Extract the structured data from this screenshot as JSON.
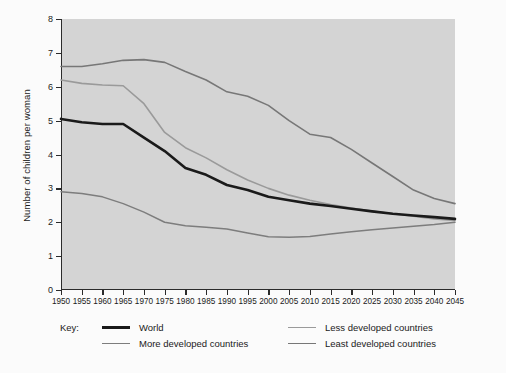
{
  "chart_data": {
    "type": "line",
    "title": "",
    "xlabel": "",
    "ylabel": "Number of children per woman",
    "xlim": [
      1950,
      2045
    ],
    "ylim": [
      0,
      8
    ],
    "yticks": [
      0,
      1,
      2,
      3,
      4,
      5,
      6,
      7,
      8
    ],
    "grid": false,
    "legend_position": "bottom",
    "legend_title": "Key:",
    "x": [
      1950,
      1955,
      1960,
      1965,
      1970,
      1975,
      1980,
      1985,
      1990,
      1995,
      2000,
      2005,
      2010,
      2015,
      2020,
      2025,
      2030,
      2035,
      2040,
      2045
    ],
    "series": [
      {
        "name": "World",
        "color": "#1a1a1a",
        "width": 2.6,
        "values": [
          5.05,
          4.95,
          4.9,
          4.9,
          4.5,
          4.1,
          3.6,
          3.4,
          3.1,
          2.95,
          2.75,
          2.65,
          2.55,
          2.48,
          2.4,
          2.32,
          2.25,
          2.2,
          2.15,
          2.1
        ]
      },
      {
        "name": "More developed countries",
        "color": "#7d7d7d",
        "width": 1.5,
        "values": [
          2.9,
          2.85,
          2.75,
          2.55,
          2.3,
          2.0,
          1.9,
          1.85,
          1.8,
          1.68,
          1.57,
          1.56,
          1.58,
          1.65,
          1.72,
          1.78,
          1.83,
          1.88,
          1.93,
          2.0
        ]
      },
      {
        "name": "Less developed countries",
        "color": "#9a9a9a",
        "width": 1.6,
        "values": [
          6.2,
          6.1,
          6.05,
          6.03,
          5.5,
          4.65,
          4.2,
          3.9,
          3.55,
          3.25,
          3.0,
          2.8,
          2.65,
          2.52,
          2.42,
          2.33,
          2.25,
          2.18,
          2.1,
          2.05
        ]
      },
      {
        "name": "Least developed countries",
        "color": "#777777",
        "width": 1.6,
        "values": [
          6.6,
          6.6,
          6.68,
          6.78,
          6.8,
          6.72,
          6.45,
          6.2,
          5.85,
          5.72,
          5.45,
          5.0,
          4.6,
          4.5,
          4.15,
          3.75,
          3.35,
          2.95,
          2.7,
          2.55
        ]
      }
    ]
  },
  "legend": {
    "key_label": "Key:",
    "entries": [
      {
        "label": "World"
      },
      {
        "label": "More developed countries"
      },
      {
        "label": "Less developed countries"
      },
      {
        "label": "Least developed countries"
      }
    ]
  },
  "colors": {
    "page_background": "#fbfbfb",
    "plot_background": "#d4d4d4",
    "axis": "#2b2b2b",
    "text": "#1a1a1a"
  }
}
